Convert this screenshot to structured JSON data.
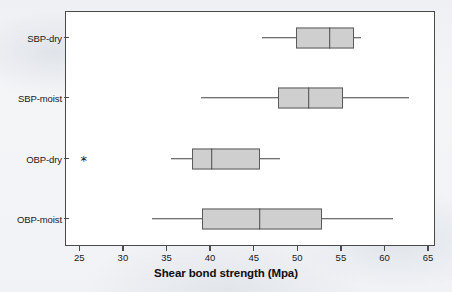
{
  "figure": {
    "background_color": "#f1f3f5",
    "plot_background_color": "#ffffff",
    "frame_color": "#4a4a4a",
    "box_fill_color": "#cfcfcf",
    "box_edge_color": "#5a5a5a"
  },
  "chart_data": {
    "type": "box",
    "title": "",
    "xlabel": "Shear bond strength (Mpa)",
    "ylabel": "",
    "xlim": [
      25,
      65
    ],
    "xticks": [
      25,
      30,
      35,
      40,
      45,
      50,
      55,
      60,
      65
    ],
    "xtick_labels": [
      "25",
      "30",
      "35",
      "40",
      "45",
      "50",
      "55",
      "60",
      "65"
    ],
    "grid": false,
    "legend": "none",
    "orientation": "horizontal",
    "categories": [
      "SBP-dry",
      "SBP-moist",
      "OBP-dry",
      "OBP-moist"
    ],
    "boxes": [
      {
        "label": "SBP-dry",
        "whisker_low": 45.9,
        "q1": 49.9,
        "median": 53.7,
        "q3": 56.5,
        "whisker_high": 57.3,
        "outliers": []
      },
      {
        "label": "SBP-moist",
        "whisker_low": 38.9,
        "q1": 47.8,
        "median": 51.3,
        "q3": 55.2,
        "whisker_high": 62.8,
        "outliers": []
      },
      {
        "label": "OBP-dry",
        "whisker_low": 35.5,
        "q1": 37.9,
        "median": 40.2,
        "q3": 45.7,
        "whisker_high": 48.0,
        "outliers": [
          25.5
        ]
      },
      {
        "label": "OBP-moist",
        "whisker_low": 33.3,
        "q1": 39.1,
        "median": 45.7,
        "q3": 52.8,
        "whisker_high": 61.0,
        "outliers": []
      }
    ],
    "outlier_marker": "*"
  }
}
